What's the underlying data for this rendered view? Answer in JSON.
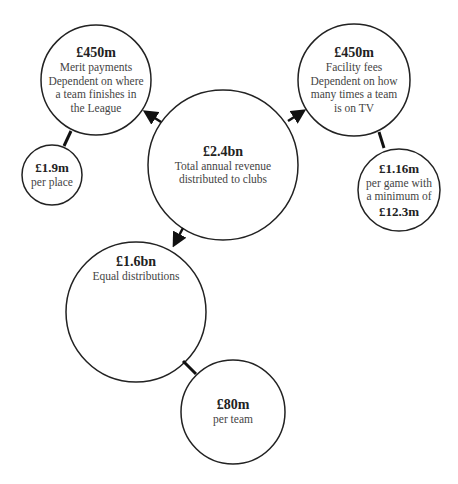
{
  "diagram": {
    "central": {
      "amount": "£2.4bn",
      "lines": [
        "Total annual revenue",
        "distributed to clubs"
      ]
    },
    "merit": {
      "amount": "£450m",
      "lines": [
        "Merit payments",
        "Dependent on where",
        "a team finishes in",
        "the League"
      ]
    },
    "merit_sub": {
      "amount": "£1.9m",
      "lines": [
        "per place"
      ]
    },
    "facility": {
      "amount": "£450m",
      "lines": [
        "Facility fees",
        "Dependent on how",
        "many times a team",
        "is on TV"
      ]
    },
    "facility_sub": {
      "amount": "£1.16m",
      "lines": [
        "per game with",
        "a minimum of"
      ],
      "amount2": "£12.3m"
    },
    "equal": {
      "amount": "£1.6bn",
      "lines": [
        "Equal distributions"
      ]
    },
    "equal_sub": {
      "amount": "£80m",
      "lines": [
        "per team"
      ]
    }
  },
  "colors": {
    "stroke": "#222222",
    "background": "#ffffff",
    "text": "#333333"
  }
}
